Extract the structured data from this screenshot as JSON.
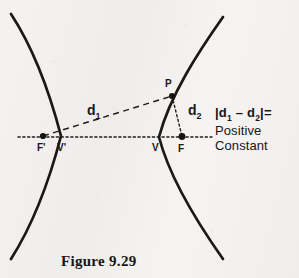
{
  "figure": {
    "caption": "Figure 9.29",
    "background_color": "#f3f2f0",
    "ink_color": "#1a1918"
  },
  "points": [
    {
      "name": "left-focus",
      "label": "F'",
      "x": 43,
      "y": 136,
      "label_x": 37,
      "label_y": 143,
      "dot": true
    },
    {
      "name": "left-vertex",
      "label": "V'",
      "x": 62,
      "y": 137,
      "label_x": 57,
      "label_y": 143,
      "dot": false
    },
    {
      "name": "right-vertex",
      "label": "V",
      "x": 158,
      "y": 137,
      "label_x": 153,
      "label_y": 143,
      "dot": false
    },
    {
      "name": "right-focus",
      "label": "F",
      "x": 182,
      "y": 137,
      "label_x": 178,
      "label_y": 144,
      "dot": true
    },
    {
      "name": "point-p",
      "label": "P",
      "x": 172,
      "y": 96,
      "label_x": 165,
      "label_y": 79,
      "dot": true
    }
  ],
  "distances": [
    {
      "name": "d1",
      "label": "d",
      "subscript": "1",
      "label_x": 88,
      "label_y": 104,
      "from": "left-focus",
      "to": "point-p",
      "style": "dashed"
    },
    {
      "name": "d2",
      "label": "d",
      "subscript": "2",
      "label_x": 188,
      "label_y": 104,
      "from": "point-p",
      "to": "right-focus",
      "style": "dotted"
    }
  ],
  "axis": {
    "label": "transverse-axis",
    "style": "dotted",
    "x1": 18,
    "y1": 137,
    "x2": 212,
    "y2": 137
  },
  "equation": {
    "abs_open": "|",
    "term_1": "d",
    "term_1_sub": "1",
    "minus": " – ",
    "term_2": "d",
    "term_2_sub": "2",
    "abs_close": "|",
    "equals": "=",
    "value_line_1": "Positive",
    "value_line_2": "Constant"
  },
  "curves": {
    "left_branch": "M 11,14 C 32,46 49,90 61,136 C 49,182 32,226 11,259",
    "right_branch": "M 223,17 C 199,51 170,95 159,137 C 170,180 199,225 223,259"
  }
}
